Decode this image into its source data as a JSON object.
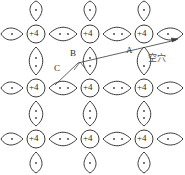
{
  "figure": {
    "colors": {
      "line": "#3a3a3a",
      "text": "#2b2b2b",
      "background": "#ffffff",
      "electron": "#3a3a3a"
    }
  },
  "lattice": {
    "core_label": "+4",
    "cores": [
      {
        "id": "core-r1c1",
        "label": "+4",
        "cx": 36,
        "cy": 34
      },
      {
        "id": "core-r1c2",
        "label": "+4",
        "cx": 90,
        "cy": 34
      },
      {
        "id": "core-r1c3",
        "label": "+4",
        "cx": 144,
        "cy": 34
      },
      {
        "id": "core-r2c1",
        "label": "+4",
        "cx": 36,
        "cy": 88
      },
      {
        "id": "core-r2c2",
        "label": "+4",
        "cx": 90,
        "cy": 88
      },
      {
        "id": "core-r2c3",
        "label": "+4",
        "cx": 144,
        "cy": 88
      },
      {
        "id": "core-r3c1",
        "label": "+4",
        "cx": 36,
        "cy": 139
      },
      {
        "id": "core-r3c2",
        "label": "+4",
        "cx": 90,
        "cy": 139
      },
      {
        "id": "core-r3c3",
        "label": "+4",
        "cx": 144,
        "cy": 139
      }
    ],
    "rows": 3,
    "columns": 3,
    "electrons_per_bond": 2,
    "bond_shape": "lens"
  },
  "annotations": {
    "a": {
      "text": "A",
      "x": 129,
      "y": 52
    },
    "b": {
      "text": "B",
      "x": 72,
      "y": 55
    },
    "c": {
      "text": "C",
      "x": 56,
      "y": 70
    },
    "hole": {
      "text": "空穴",
      "x": 148,
      "y": 59
    }
  },
  "arrow": {
    "name": "carrier-motion-arrow",
    "from": {
      "x": 55,
      "y": 85
    },
    "to": {
      "x": 178,
      "y": 39
    },
    "mid": {
      "x": 78,
      "y": 63
    }
  }
}
